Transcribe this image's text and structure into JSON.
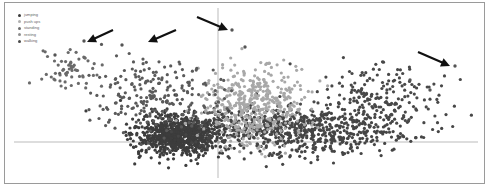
{
  "chart_data": {
    "type": "scatter",
    "title": "",
    "xlabel": "",
    "ylabel": "",
    "legend_position": "top-left",
    "grid": false,
    "axes": {
      "x_axis_y_px": 142,
      "y_axis_x_px": 218
    },
    "series": [
      {
        "name": "jumping",
        "color": "#3a3a3a"
      },
      {
        "name": "push ups",
        "color": "#b0b0b0"
      },
      {
        "name": "standing",
        "color": "#6e6e6e"
      },
      {
        "name": "resting",
        "color": "#8e8e8e"
      },
      {
        "name": "walking",
        "color": "#4a4a4a"
      }
    ],
    "clusters": [
      {
        "series": "walking",
        "cx": 180,
        "cy": 135,
        "rx": 40,
        "ry": 18,
        "n": 900,
        "color": "#3d3d3d"
      },
      {
        "series": "jumping",
        "cx": 300,
        "cy": 130,
        "rx": 95,
        "ry": 22,
        "n": 700,
        "color": "#454545"
      },
      {
        "series": "push ups",
        "cx": 255,
        "cy": 105,
        "rx": 45,
        "ry": 35,
        "n": 450,
        "color": "#a8a8a8"
      },
      {
        "series": "standing",
        "cx": 150,
        "cy": 95,
        "rx": 60,
        "ry": 35,
        "n": 220,
        "color": "#5a5a5a"
      },
      {
        "series": "resting",
        "cx": 70,
        "cy": 70,
        "rx": 25,
        "ry": 20,
        "n": 60,
        "color": "#6a6a6a"
      },
      {
        "series": "jumping",
        "cx": 380,
        "cy": 95,
        "rx": 55,
        "ry": 30,
        "n": 180,
        "color": "#484848"
      }
    ],
    "outliers": [
      [
        84,
        41
      ],
      [
        122,
        45
      ],
      [
        232,
        30
      ],
      [
        245,
        47
      ],
      [
        455,
        66
      ],
      [
        430,
        90
      ],
      [
        410,
        80
      ],
      [
        55,
        55
      ]
    ],
    "annotations": [
      {
        "type": "arrow",
        "from": [
          113,
          30
        ],
        "to": [
          87,
          42
        ]
      },
      {
        "type": "arrow",
        "from": [
          176,
          30
        ],
        "to": [
          148,
          42
        ]
      },
      {
        "type": "arrow",
        "from": [
          197,
          17
        ],
        "to": [
          228,
          30
        ]
      },
      {
        "type": "arrow",
        "from": [
          418,
          52
        ],
        "to": [
          450,
          66
        ]
      }
    ]
  },
  "legend": {
    "items": [
      {
        "label": "jumping",
        "color": "#3a3a3a"
      },
      {
        "label": "push ups",
        "color": "#b0b0b0"
      },
      {
        "label": "standing",
        "color": "#6e6e6e"
      },
      {
        "label": "resting",
        "color": "#8e8e8e"
      },
      {
        "label": "walking",
        "color": "#4a4a4a"
      }
    ]
  }
}
